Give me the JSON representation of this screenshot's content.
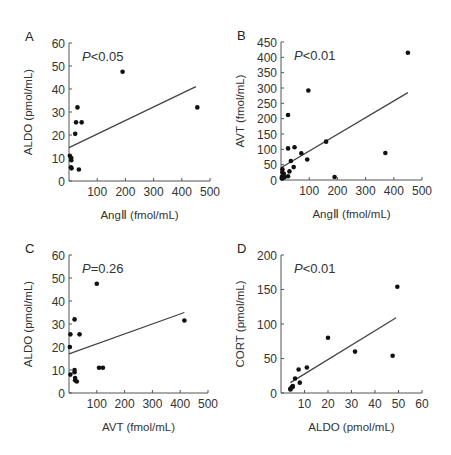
{
  "chart_data": [
    {
      "panel": "A",
      "type": "scatter",
      "title": "",
      "annotation": "P<0.05",
      "xlabel": "AngⅡ (fmol/mL)",
      "ylabel": "ALDO (pmol/mL)",
      "xlim": [
        0,
        500
      ],
      "ylim": [
        0,
        60
      ],
      "xticks": [
        100,
        200,
        300,
        400,
        500
      ],
      "yticks": [
        0,
        10,
        20,
        30,
        40,
        50,
        60
      ],
      "grid": false,
      "points": [
        [
          3,
          11
        ],
        [
          8,
          10
        ],
        [
          8,
          9
        ],
        [
          7,
          6
        ],
        [
          9,
          5.5
        ],
        [
          25,
          25.5
        ],
        [
          30,
          32
        ],
        [
          22,
          20.5
        ],
        [
          45,
          25.5
        ],
        [
          35,
          5
        ],
        [
          190,
          47.5
        ],
        [
          455,
          32
        ]
      ],
      "regression": [
        [
          0,
          14.5
        ],
        [
          450,
          41
        ]
      ]
    },
    {
      "panel": "B",
      "type": "scatter",
      "title": "",
      "annotation": "P<0.01",
      "xlabel": "AngⅡ (fmol/mL)",
      "ylabel": "AVT (fmol/mL)",
      "xlim": [
        0,
        500
      ],
      "ylim": [
        0,
        450
      ],
      "xticks": [
        100,
        200,
        300,
        400,
        500
      ],
      "yticks": [
        0,
        50,
        100,
        150,
        200,
        250,
        300,
        350,
        400,
        450
      ],
      "grid": false,
      "points": [
        [
          450,
          415
        ],
        [
          97,
          292
        ],
        [
          25,
          212
        ],
        [
          160,
          125
        ],
        [
          25,
          103
        ],
        [
          48,
          107
        ],
        [
          72,
          87
        ],
        [
          93,
          67
        ],
        [
          35,
          62
        ],
        [
          45,
          42
        ],
        [
          370,
          88
        ],
        [
          190,
          10
        ],
        [
          30,
          28
        ],
        [
          25,
          12
        ],
        [
          5,
          35
        ],
        [
          5,
          25
        ],
        [
          8,
          15
        ],
        [
          3,
          5
        ],
        [
          10,
          20
        ],
        [
          3,
          10
        ],
        [
          12,
          8
        ]
      ],
      "regression": [
        [
          0,
          40
        ],
        [
          450,
          285
        ]
      ]
    },
    {
      "panel": "C",
      "type": "scatter",
      "title": "",
      "annotation": "P=0.26",
      "xlabel": "AVT (fmol/mL)",
      "ylabel": "ALDO (pmol/mL)",
      "xlim": [
        0,
        500
      ],
      "ylim": [
        0,
        60
      ],
      "xticks": [
        100,
        200,
        300,
        400,
        500
      ],
      "yticks": [
        0,
        10,
        20,
        30,
        40,
        50,
        60
      ],
      "grid": false,
      "points": [
        [
          100,
          47.5
        ],
        [
          20,
          32
        ],
        [
          5,
          25.5
        ],
        [
          38,
          25.5
        ],
        [
          3,
          20
        ],
        [
          415,
          31.5
        ],
        [
          108,
          11
        ],
        [
          122,
          11
        ],
        [
          20,
          10
        ],
        [
          20,
          9
        ],
        [
          5,
          8
        ],
        [
          22,
          6.5
        ],
        [
          22,
          5.5
        ],
        [
          28,
          5
        ]
      ],
      "regression": [
        [
          0,
          17
        ],
        [
          415,
          35
        ]
      ]
    },
    {
      "panel": "D",
      "type": "scatter",
      "title": "",
      "annotation": "P<0.01",
      "xlabel": "ALDO (pmol/mL)",
      "ylabel": "CORT (pmol/mL)",
      "xlim": [
        0,
        60
      ],
      "ylim": [
        0,
        200
      ],
      "xticks": [
        10,
        20,
        30,
        40,
        50,
        60
      ],
      "yticks": [
        0,
        50,
        100,
        150,
        200
      ],
      "grid": false,
      "points": [
        [
          49.5,
          154
        ],
        [
          20,
          80
        ],
        [
          31.5,
          60
        ],
        [
          47.5,
          54
        ],
        [
          11,
          37
        ],
        [
          7.5,
          34
        ],
        [
          6,
          21
        ],
        [
          8,
          15
        ],
        [
          5,
          10
        ],
        [
          4.5,
          8
        ],
        [
          4,
          6
        ],
        [
          4,
          5
        ],
        [
          5,
          9
        ]
      ],
      "regression": [
        [
          4,
          15
        ],
        [
          49,
          109
        ]
      ]
    }
  ],
  "layout": [
    {
      "x0": 69,
      "x1": 210,
      "y0": 181,
      "y1": 43
    },
    {
      "x0": 281,
      "x1": 422,
      "y0": 180,
      "y1": 42
    },
    {
      "x0": 69,
      "x1": 208,
      "y0": 393,
      "y1": 255
    },
    {
      "x0": 281,
      "x1": 422,
      "y0": 393,
      "y1": 255
    }
  ]
}
